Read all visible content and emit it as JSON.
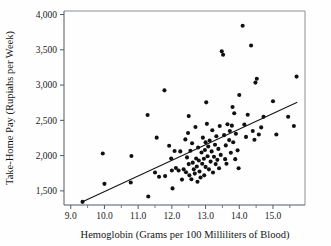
{
  "chart_data": {
    "type": "scatter",
    "title": "",
    "xlabel": "Hemoglobin (Grams per 100 Milliliters of Blood)",
    "ylabel": "Take-Home Pay (Rupiahs per Week)",
    "xlim": [
      8.8,
      15.95
    ],
    "ylim": [
      1300,
      4050
    ],
    "x_ticks": [
      9.0,
      10.0,
      11.0,
      12.0,
      13.0,
      14.0,
      15.0
    ],
    "x_tick_labels": [
      "9.0",
      "10.0",
      "11.0",
      "12.0",
      "13.0",
      "14.0",
      "15.0"
    ],
    "x_minor_ticks": [
      9.5,
      10.5,
      11.5,
      12.5,
      13.5,
      14.5,
      15.5
    ],
    "y_ticks": [
      1500,
      2000,
      2500,
      3000,
      3500,
      4000
    ],
    "y_tick_labels": [
      "1,500",
      "2,000",
      "2,500",
      "3,000",
      "3,500",
      "4,000"
    ],
    "grid": false,
    "legend": null,
    "marker_color": "#101010",
    "marker_size": 3.1,
    "trendline": {
      "label": "regression line",
      "color": "#141414",
      "x_start": 9.35,
      "y_start": 1345,
      "x_end": 15.72,
      "y_end": 2755
    },
    "points": [
      {
        "x": 9.35,
        "y": 1345
      },
      {
        "x": 9.95,
        "y": 2030
      },
      {
        "x": 10.0,
        "y": 1600
      },
      {
        "x": 10.8,
        "y": 1995
      },
      {
        "x": 10.78,
        "y": 1620
      },
      {
        "x": 11.28,
        "y": 2575
      },
      {
        "x": 11.3,
        "y": 1420
      },
      {
        "x": 11.5,
        "y": 1760
      },
      {
        "x": 11.55,
        "y": 2255
      },
      {
        "x": 11.62,
        "y": 1700
      },
      {
        "x": 11.78,
        "y": 2925
      },
      {
        "x": 11.8,
        "y": 1710
      },
      {
        "x": 11.92,
        "y": 2140
      },
      {
        "x": 11.98,
        "y": 1960
      },
      {
        "x": 12.0,
        "y": 1790
      },
      {
        "x": 12.02,
        "y": 1535
      },
      {
        "x": 12.08,
        "y": 2065
      },
      {
        "x": 12.12,
        "y": 1825
      },
      {
        "x": 12.2,
        "y": 1790
      },
      {
        "x": 12.25,
        "y": 2060
      },
      {
        "x": 12.3,
        "y": 1660
      },
      {
        "x": 12.35,
        "y": 1805
      },
      {
        "x": 12.4,
        "y": 2230
      },
      {
        "x": 12.42,
        "y": 1765
      },
      {
        "x": 12.45,
        "y": 1975
      },
      {
        "x": 12.48,
        "y": 2320
      },
      {
        "x": 12.5,
        "y": 2560
      },
      {
        "x": 12.5,
        "y": 1880
      },
      {
        "x": 12.52,
        "y": 1720
      },
      {
        "x": 12.55,
        "y": 2070
      },
      {
        "x": 12.58,
        "y": 1665
      },
      {
        "x": 12.6,
        "y": 2175
      },
      {
        "x": 12.62,
        "y": 1900
      },
      {
        "x": 12.65,
        "y": 1805
      },
      {
        "x": 12.68,
        "y": 1745
      },
      {
        "x": 12.7,
        "y": 2405
      },
      {
        "x": 12.72,
        "y": 1960
      },
      {
        "x": 12.74,
        "y": 1845
      },
      {
        "x": 12.76,
        "y": 1630
      },
      {
        "x": 12.78,
        "y": 2115
      },
      {
        "x": 12.8,
        "y": 1930
      },
      {
        "x": 12.82,
        "y": 1775
      },
      {
        "x": 12.85,
        "y": 1690
      },
      {
        "x": 12.88,
        "y": 2045
      },
      {
        "x": 12.9,
        "y": 1885
      },
      {
        "x": 12.92,
        "y": 2255
      },
      {
        "x": 12.95,
        "y": 1955
      },
      {
        "x": 12.96,
        "y": 1720
      },
      {
        "x": 12.98,
        "y": 2080
      },
      {
        "x": 13.0,
        "y": 2190
      },
      {
        "x": 13.0,
        "y": 1840
      },
      {
        "x": 13.02,
        "y": 2755
      },
      {
        "x": 13.04,
        "y": 2450
      },
      {
        "x": 13.06,
        "y": 1990
      },
      {
        "x": 13.08,
        "y": 2130
      },
      {
        "x": 13.1,
        "y": 1805
      },
      {
        "x": 13.12,
        "y": 2215
      },
      {
        "x": 13.15,
        "y": 1915
      },
      {
        "x": 13.18,
        "y": 2060
      },
      {
        "x": 13.2,
        "y": 2360
      },
      {
        "x": 13.22,
        "y": 1760
      },
      {
        "x": 13.25,
        "y": 1985
      },
      {
        "x": 13.28,
        "y": 2155
      },
      {
        "x": 13.3,
        "y": 1880
      },
      {
        "x": 13.32,
        "y": 2275
      },
      {
        "x": 13.35,
        "y": 1940
      },
      {
        "x": 13.38,
        "y": 2095
      },
      {
        "x": 13.4,
        "y": 1820
      },
      {
        "x": 13.42,
        "y": 2420
      },
      {
        "x": 13.45,
        "y": 2010
      },
      {
        "x": 13.48,
        "y": 3480
      },
      {
        "x": 13.52,
        "y": 3430
      },
      {
        "x": 13.55,
        "y": 2290
      },
      {
        "x": 13.58,
        "y": 1950
      },
      {
        "x": 13.6,
        "y": 2145
      },
      {
        "x": 13.62,
        "y": 1885
      },
      {
        "x": 13.65,
        "y": 2445
      },
      {
        "x": 13.7,
        "y": 2220
      },
      {
        "x": 13.72,
        "y": 2350
      },
      {
        "x": 13.75,
        "y": 2040
      },
      {
        "x": 13.78,
        "y": 2425
      },
      {
        "x": 13.8,
        "y": 2690
      },
      {
        "x": 13.82,
        "y": 2190
      },
      {
        "x": 13.85,
        "y": 2600
      },
      {
        "x": 13.88,
        "y": 1950
      },
      {
        "x": 13.9,
        "y": 2310
      },
      {
        "x": 13.95,
        "y": 2075
      },
      {
        "x": 13.98,
        "y": 1820
      },
      {
        "x": 14.0,
        "y": 2860
      },
      {
        "x": 14.1,
        "y": 3840
      },
      {
        "x": 14.15,
        "y": 2440
      },
      {
        "x": 14.2,
        "y": 2265
      },
      {
        "x": 14.25,
        "y": 2580
      },
      {
        "x": 14.35,
        "y": 3560
      },
      {
        "x": 14.4,
        "y": 2350
      },
      {
        "x": 14.45,
        "y": 2225
      },
      {
        "x": 14.48,
        "y": 3035
      },
      {
        "x": 14.52,
        "y": 3090
      },
      {
        "x": 14.58,
        "y": 2300
      },
      {
        "x": 14.65,
        "y": 2400
      },
      {
        "x": 14.72,
        "y": 2550
      },
      {
        "x": 15.0,
        "y": 2770
      },
      {
        "x": 15.1,
        "y": 2300
      },
      {
        "x": 15.45,
        "y": 2550
      },
      {
        "x": 15.62,
        "y": 2420
      },
      {
        "x": 15.7,
        "y": 3120
      }
    ]
  }
}
